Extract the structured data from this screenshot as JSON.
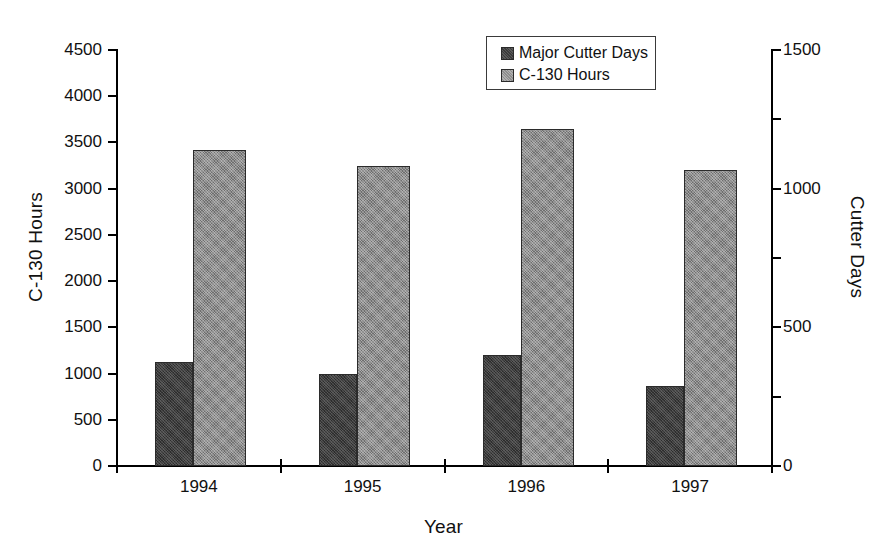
{
  "chart_data": {
    "type": "bar",
    "title": "",
    "categories": [
      "1994",
      "1995",
      "1996",
      "1997"
    ],
    "xlabel": "Year",
    "series": [
      {
        "name": "Major Cutter Days",
        "axis": "right",
        "color": "#3c3c3c",
        "values": [
          375,
          330,
          400,
          290
        ]
      },
      {
        "name": "C-130 Hours",
        "axis": "left",
        "color": "#8d8d8d",
        "values": [
          3420,
          3250,
          3650,
          3200
        ]
      }
    ],
    "left_axis": {
      "label": "C-130 Hours",
      "ylim": [
        0,
        4500
      ],
      "ticks": [
        0,
        500,
        1000,
        1500,
        2000,
        2500,
        3000,
        3500,
        4000,
        4500
      ],
      "tick_labels": [
        "0",
        "500",
        "1000",
        "1500",
        "2000",
        "2500",
        "3000",
        "3500",
        "4000",
        "4500"
      ]
    },
    "right_axis": {
      "label": "Cutter Days",
      "ylim": [
        0,
        1500
      ],
      "ticks": [
        0,
        250,
        500,
        750,
        1000,
        1250,
        1500
      ],
      "labeled_ticks": [
        0,
        500,
        1000,
        1500
      ],
      "tick_labels": [
        "0",
        "500",
        "1000",
        "1500"
      ]
    },
    "grid": false,
    "legend_position": "top-center",
    "legend_entries": [
      "Major Cutter Days",
      "C-130 Hours"
    ]
  },
  "legend": {
    "entries": [
      {
        "label": "Major Cutter Days",
        "swatch": "dark-swatch-icon"
      },
      {
        "label": "C-130 Hours",
        "swatch": "light-swatch-icon"
      }
    ]
  }
}
